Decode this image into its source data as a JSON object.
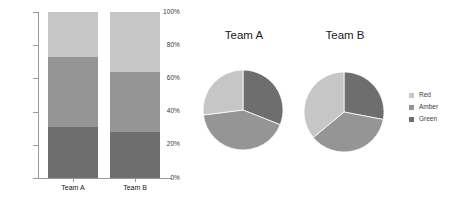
{
  "chart_data": [
    {
      "type": "bar",
      "subtype": "stacked-percentage",
      "title": "",
      "xlabel": "",
      "ylabel": "",
      "categories": [
        "Team A",
        "Team B"
      ],
      "series": [
        {
          "name": "Green",
          "values": [
            31,
            28
          ],
          "color": "#6e6e6e"
        },
        {
          "name": "Amber",
          "values": [
            42,
            36
          ],
          "color": "#959595"
        },
        {
          "name": "Red",
          "values": [
            27,
            36
          ],
          "color": "#c6c6c6"
        }
      ],
      "ylim": [
        0,
        100
      ],
      "yticks": [
        0,
        20,
        40,
        60,
        80,
        100
      ],
      "ytick_labels": [
        "0%",
        "20%",
        "40%",
        "60%",
        "80%",
        "100%"
      ],
      "grid": false,
      "legend": "none"
    },
    {
      "type": "pie",
      "title": "Team A",
      "labels": [
        "Green",
        "Amber",
        "Red"
      ],
      "values": [
        31,
        42,
        27
      ],
      "colors": [
        "#6e6e6e",
        "#959595",
        "#c6c6c6"
      ],
      "start_angle_deg": 0,
      "direction": "clockwise",
      "legend": "right"
    },
    {
      "type": "pie",
      "title": "Team B",
      "labels": [
        "Green",
        "Amber",
        "Red"
      ],
      "values": [
        28,
        36,
        36
      ],
      "colors": [
        "#6e6e6e",
        "#959595",
        "#c6c6c6"
      ],
      "start_angle_deg": 0,
      "direction": "clockwise",
      "legend": "right"
    }
  ],
  "bar_chart": {
    "y_ticks": [
      {
        "label": "100%",
        "value": 100
      },
      {
        "label": "80%",
        "value": 80
      },
      {
        "label": "60%",
        "value": 60
      },
      {
        "label": "40%",
        "value": 40
      },
      {
        "label": "20%",
        "value": 20
      },
      {
        "label": "0%",
        "value": 0
      }
    ],
    "bars": [
      {
        "category": "Team A",
        "segments": [
          {
            "name": "Red",
            "value": 27,
            "color": "#c6c6c6"
          },
          {
            "name": "Amber",
            "value": 42,
            "color": "#959595"
          },
          {
            "name": "Green",
            "value": 31,
            "color": "#6e6e6e"
          }
        ]
      },
      {
        "category": "Team B",
        "segments": [
          {
            "name": "Red",
            "value": 36,
            "color": "#c6c6c6"
          },
          {
            "name": "Amber",
            "value": 36,
            "color": "#959595"
          },
          {
            "name": "Green",
            "value": 28,
            "color": "#6e6e6e"
          }
        ]
      }
    ]
  },
  "pies": [
    {
      "title": "Team A",
      "slices": [
        {
          "name": "Green",
          "value": 31,
          "color": "#6e6e6e"
        },
        {
          "name": "Amber",
          "value": 42,
          "color": "#959595"
        },
        {
          "name": "Red",
          "value": 27,
          "color": "#c6c6c6"
        }
      ]
    },
    {
      "title": "Team B",
      "slices": [
        {
          "name": "Green",
          "value": 28,
          "color": "#6e6e6e"
        },
        {
          "name": "Amber",
          "value": 36,
          "color": "#959595"
        },
        {
          "name": "Red",
          "value": 36,
          "color": "#c6c6c6"
        }
      ]
    }
  ],
  "legend": {
    "items": [
      {
        "label": "Red",
        "color": "#c6c6c6"
      },
      {
        "label": "Amber",
        "color": "#959595"
      },
      {
        "label": "Green",
        "color": "#6e6e6e"
      }
    ]
  }
}
